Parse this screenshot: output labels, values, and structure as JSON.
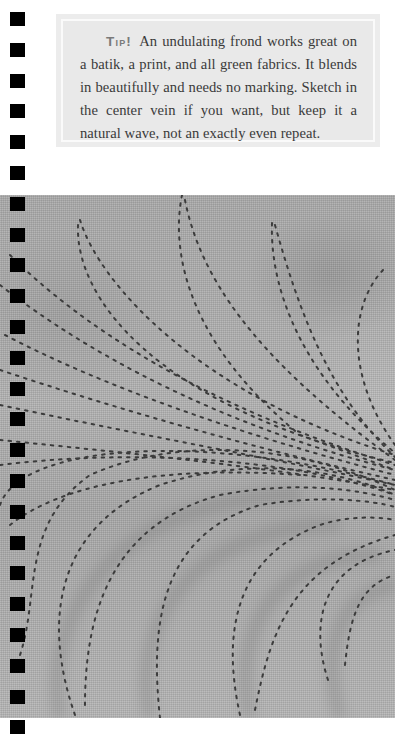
{
  "tip": {
    "label": "Tip!",
    "text": "An undulating frond works great on a batik, a print, and all green fabrics. It blends in beautifully and needs no marking. Sketch in the center vein if you want, but keep it a natural wave, not an exactly even repeat."
  },
  "photo": {
    "description": "Close-up of gray quilted fabric with dotted stitching forming an undulating frond pattern",
    "stitch_color": "#3c3c3c",
    "fabric_color": "#adadad"
  },
  "binding": {
    "hole_count": 24,
    "hole_color": "#000000"
  }
}
